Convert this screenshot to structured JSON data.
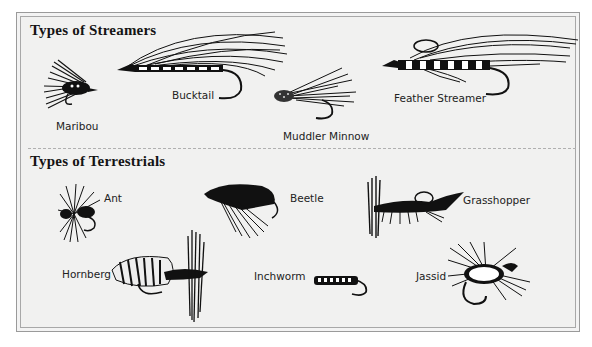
{
  "sections": [
    {
      "title": "Types of Streamers",
      "items": [
        {
          "name": "Maribou"
        },
        {
          "name": "Bucktail"
        },
        {
          "name": "Muddler Minnow"
        },
        {
          "name": "Feather Streamer"
        }
      ]
    },
    {
      "title": "Types of Terrestrials",
      "items": [
        {
          "name": "Ant"
        },
        {
          "name": "Beetle"
        },
        {
          "name": "Grasshopper"
        },
        {
          "name": "Hornberg"
        },
        {
          "name": "Inchworm"
        },
        {
          "name": "Jassid"
        }
      ]
    }
  ],
  "colors": {
    "ink": "#141414",
    "background": "#f1f1f0",
    "frame": "#9a9a9a",
    "divider": "#b0b0b0"
  }
}
